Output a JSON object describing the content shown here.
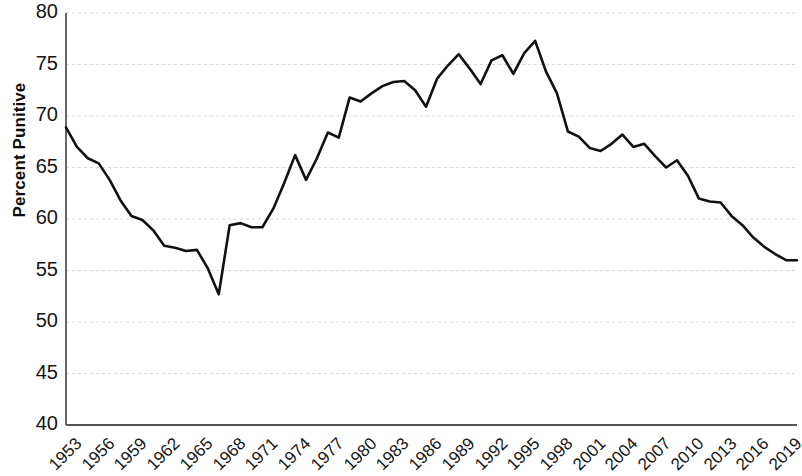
{
  "chart_data": {
    "type": "line",
    "title": "",
    "xlabel": "",
    "ylabel": "Percent Punitive",
    "ylim": [
      40,
      80
    ],
    "xlim": [
      1953,
      2020
    ],
    "yticks": [
      40,
      45,
      50,
      55,
      60,
      65,
      70,
      75,
      80
    ],
    "xticks": [
      1953,
      1956,
      1959,
      1962,
      1965,
      1968,
      1971,
      1974,
      1977,
      1980,
      1983,
      1986,
      1989,
      1992,
      1995,
      1998,
      2001,
      2004,
      2007,
      2010,
      2013,
      2016,
      2019
    ],
    "grid": true,
    "grid_axis": "y",
    "legend": "none",
    "line_color": "#111111",
    "grid_color": "#d8d8d8",
    "axis_color": "#555555",
    "series": [
      {
        "name": "Percent Punitive",
        "x": [
          1953,
          1954,
          1955,
          1956,
          1957,
          1958,
          1959,
          1960,
          1961,
          1962,
          1963,
          1964,
          1965,
          1966,
          1967,
          1968,
          1969,
          1970,
          1971,
          1972,
          1973,
          1974,
          1975,
          1976,
          1977,
          1978,
          1979,
          1980,
          1981,
          1982,
          1983,
          1984,
          1985,
          1986,
          1987,
          1988,
          1989,
          1990,
          1991,
          1992,
          1993,
          1994,
          1995,
          1996,
          1997,
          1998,
          1999,
          2000,
          2001,
          2002,
          2003,
          2004,
          2005,
          2006,
          2007,
          2008,
          2009,
          2010,
          2011,
          2012,
          2013,
          2014,
          2015,
          2016,
          2017,
          2018,
          2019,
          2020
        ],
        "values": [
          68.9,
          67.0,
          65.9,
          65.4,
          63.8,
          61.8,
          60.3,
          59.9,
          58.9,
          57.4,
          57.2,
          56.9,
          57.0,
          55.2,
          52.7,
          59.4,
          59.6,
          59.2,
          59.2,
          61.0,
          63.5,
          66.2,
          63.8,
          65.9,
          68.4,
          67.9,
          71.8,
          71.4,
          72.2,
          72.9,
          73.3,
          73.4,
          72.5,
          70.9,
          73.6,
          74.9,
          76.0,
          74.6,
          73.1,
          75.4,
          75.9,
          74.1,
          76.1,
          77.3,
          74.3,
          72.2,
          68.5,
          68.0,
          66.9,
          66.6,
          67.3,
          68.2,
          67.0,
          67.3,
          66.1,
          65.0,
          65.7,
          64.2,
          62.0,
          61.7,
          61.6,
          60.3,
          59.4,
          58.2,
          57.3,
          56.6,
          56.0,
          56.0
        ]
      }
    ]
  }
}
